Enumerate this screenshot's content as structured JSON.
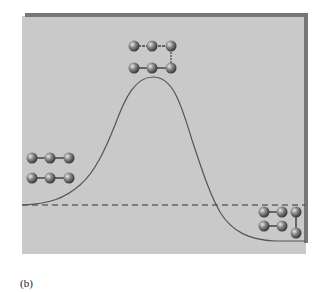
{
  "figure": {
    "caption": "(b)",
    "panel": {
      "background": "#c9c9c9",
      "border": "#6e6e6e"
    },
    "curve": {
      "type": "energy-profile",
      "stroke": "#555555",
      "points": [
        [
          22,
          205
        ],
        [
          45,
          203
        ],
        [
          60,
          197
        ],
        [
          80,
          185
        ],
        [
          100,
          160
        ],
        [
          113,
          130
        ],
        [
          125,
          100
        ],
        [
          140,
          80
        ],
        [
          153,
          77
        ],
        [
          165,
          80
        ],
        [
          180,
          110
        ],
        [
          190,
          140
        ],
        [
          200,
          165
        ],
        [
          210,
          190
        ],
        [
          216,
          205
        ],
        [
          228,
          222
        ],
        [
          245,
          235
        ],
        [
          265,
          240
        ],
        [
          305,
          241
        ]
      ]
    },
    "reference_line": {
      "style": "dashed",
      "y": 205
    },
    "molecules": [
      {
        "label": "reactants",
        "position": "left",
        "rows": 2,
        "atoms_per_row": 3
      },
      {
        "label": "transition-state",
        "position": "top",
        "rows": 2,
        "atoms_per_row": 3,
        "bridged": true
      },
      {
        "label": "products",
        "position": "right",
        "rows": 2,
        "atoms_per_row": 3,
        "bonded_column": true
      }
    ]
  }
}
